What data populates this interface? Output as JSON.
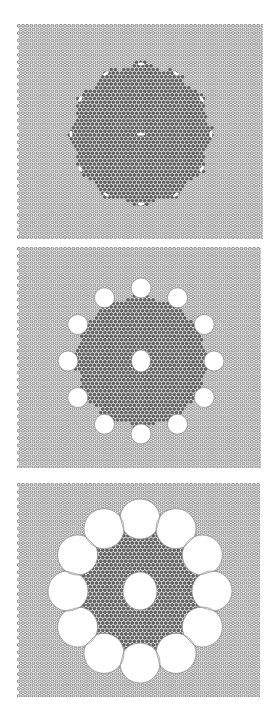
{
  "figure": {
    "colors": {
      "background": "#ffffff",
      "lattice_fill": "#d8d8d8",
      "lattice_stroke": "#7a7a7a",
      "dark_region": "#6b6b6b",
      "dark_stroke": "#4a4a4a",
      "void_fill": "#ffffff",
      "void_stroke": "#8a8a8a"
    },
    "lattice": {
      "spacing": 4.2,
      "row_height": 3.64,
      "dot_radius": 1.5
    },
    "panels": [
      {
        "id": "panel-1",
        "x": 17,
        "y": 24,
        "width": 246,
        "height": 215,
        "center": [
          124,
          110
        ],
        "dark_radius": 70,
        "ring_count": 12,
        "ring_radius": 70,
        "void_radius": 2.2,
        "center_void": [
          4,
          1.6
        ],
        "void_style": "sliver"
      },
      {
        "id": "panel-2",
        "x": 17,
        "y": 247,
        "width": 244,
        "height": 221,
        "center": [
          124,
          114
        ],
        "dark_radius": 66,
        "ring_count": 12,
        "ring_radius": 73,
        "void_radius": 10,
        "center_void": [
          9.5,
          11
        ],
        "void_style": "disc"
      },
      {
        "id": "panel-3",
        "x": 17,
        "y": 483,
        "width": 243,
        "height": 214,
        "center": [
          123,
          108
        ],
        "dark_radius": 70,
        "ring_count": 12,
        "ring_radius": 72,
        "void_radius": 20,
        "center_void": [
          17,
          19
        ],
        "void_style": "faceted"
      }
    ]
  }
}
